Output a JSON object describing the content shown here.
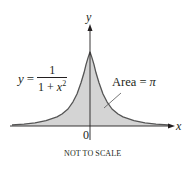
{
  "figure": {
    "equation": {
      "lhs": "y",
      "equals": "=",
      "numerator": "1",
      "denominator_base": "1 + ",
      "denominator_var": "x",
      "denominator_exp": "2"
    },
    "area_label": {
      "text": "Area = ",
      "symbol": "π"
    },
    "axis_labels": {
      "x": "x",
      "y": "y",
      "origin": "0"
    },
    "note": "NOT TO SCALE",
    "colors": {
      "fill": "#d4d4d4",
      "curve": "#555555",
      "axis": "#231f20"
    }
  }
}
